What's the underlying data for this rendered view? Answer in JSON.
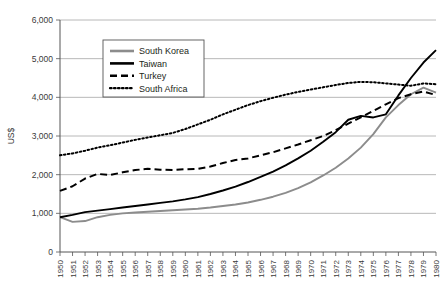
{
  "chart_data": {
    "type": "line",
    "title": "",
    "xlabel": "",
    "ylabel": "US$",
    "ylim": [
      0,
      6000
    ],
    "ytick_labels": [
      "0",
      "1,000",
      "2,000",
      "3,000",
      "4,000",
      "5,000",
      "6,000"
    ],
    "ytick_values": [
      0,
      1000,
      2000,
      3000,
      4000,
      5000,
      6000
    ],
    "grid": true,
    "legend_position": "upper-left-inside",
    "x": [
      1950,
      1951,
      1952,
      1953,
      1954,
      1955,
      1956,
      1957,
      1958,
      1959,
      1960,
      1961,
      1962,
      1963,
      1964,
      1965,
      1966,
      1967,
      1968,
      1969,
      1970,
      1971,
      1972,
      1973,
      1974,
      1975,
      1976,
      1977,
      1978,
      1979,
      1980
    ],
    "categories": [
      "1950",
      "1951",
      "1952",
      "1953",
      "1954",
      "1955",
      "1956",
      "1957",
      "1958",
      "1959",
      "1960",
      "1961",
      "1962",
      "1963",
      "1964",
      "1965",
      "1966",
      "1967",
      "1968",
      "1969",
      "1970",
      "1971",
      "1972",
      "1973",
      "1974",
      "1975",
      "1976",
      "1977",
      "1978",
      "1979",
      "1980"
    ],
    "series": [
      {
        "name": "South Korea",
        "color": "#8c8c8c",
        "style": "solid",
        "values": [
          900,
          780,
          800,
          900,
          960,
          1000,
          1020,
          1040,
          1060,
          1080,
          1100,
          1120,
          1150,
          1190,
          1230,
          1280,
          1350,
          1430,
          1530,
          1650,
          1800,
          1980,
          2180,
          2420,
          2700,
          3050,
          3480,
          3800,
          4080,
          4250,
          4120
        ]
      },
      {
        "name": "Taiwan",
        "color": "#000000",
        "style": "solid",
        "values": [
          900,
          960,
          1030,
          1070,
          1110,
          1150,
          1190,
          1230,
          1270,
          1310,
          1360,
          1420,
          1500,
          1590,
          1690,
          1810,
          1940,
          2080,
          2240,
          2420,
          2620,
          2850,
          3100,
          3420,
          3520,
          3480,
          3560,
          4050,
          4500,
          4900,
          5220
        ]
      },
      {
        "name": "Turkey",
        "color": "#000000",
        "style": "dashed",
        "values": [
          1580,
          1700,
          1900,
          2020,
          1990,
          2060,
          2120,
          2150,
          2130,
          2120,
          2140,
          2150,
          2210,
          2300,
          2380,
          2420,
          2500,
          2580,
          2680,
          2780,
          2890,
          3000,
          3150,
          3320,
          3480,
          3650,
          3820,
          3980,
          4080,
          4150,
          4060
        ]
      },
      {
        "name": "South Africa",
        "color": "#000000",
        "style": "dotted",
        "values": [
          2500,
          2550,
          2620,
          2700,
          2760,
          2830,
          2900,
          2960,
          3020,
          3080,
          3180,
          3300,
          3420,
          3560,
          3680,
          3800,
          3900,
          3990,
          4070,
          4140,
          4200,
          4260,
          4320,
          4370,
          4400,
          4390,
          4360,
          4330,
          4300,
          4360,
          4340
        ]
      }
    ]
  },
  "legend": {
    "items": [
      {
        "label": "South Korea"
      },
      {
        "label": "Taiwan"
      },
      {
        "label": "Turkey"
      },
      {
        "label": "South Africa"
      }
    ]
  }
}
